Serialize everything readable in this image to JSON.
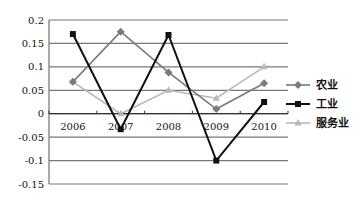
{
  "chart_data": {
    "type": "line",
    "title": "",
    "xlabel": "",
    "ylabel": "",
    "categories": [
      "2006",
      "2007",
      "2008",
      "2009",
      "2010"
    ],
    "ylim": [
      -0.15,
      0.2
    ],
    "yticks": [
      "0.2",
      "0.15",
      "0.1",
      "0.05",
      "0",
      "-0.05",
      "-0.1",
      "-0.15"
    ],
    "grid": true,
    "legend_position": "right",
    "series": [
      {
        "name": "农业",
        "color": "#7a7a7a",
        "marker": "diamond",
        "values": [
          0.068,
          0.175,
          0.088,
          0.01,
          0.065
        ]
      },
      {
        "name": "工业",
        "color": "#111111",
        "marker": "square",
        "values": [
          0.17,
          -0.033,
          0.168,
          -0.1,
          0.025
        ]
      },
      {
        "name": "服务业",
        "color": "#b8b8b8",
        "marker": "triangle",
        "values": [
          0.068,
          0.0,
          0.05,
          0.033,
          0.1
        ]
      }
    ]
  }
}
